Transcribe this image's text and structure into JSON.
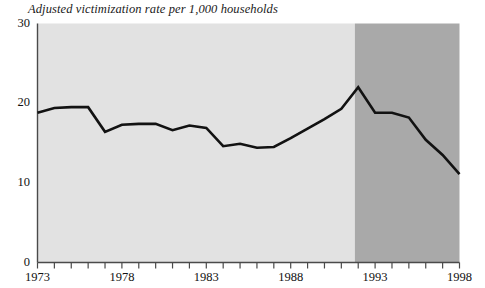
{
  "chart_data": {
    "type": "line",
    "title": "Adjusted victimization rate per 1,000 households",
    "xlabel": "",
    "ylabel": "",
    "ylim": [
      0,
      30
    ],
    "xlim": [
      1973,
      1998
    ],
    "grid": false,
    "legend": null,
    "y_ticks": [
      "0",
      "10",
      "20",
      "30"
    ],
    "y_tick_values": [
      0,
      10,
      20,
      30
    ],
    "x_tick_labels": [
      "1973",
      "1978",
      "1983",
      "1988",
      "1993",
      "1998"
    ],
    "x_tick_label_values": [
      1973,
      1978,
      1983,
      1988,
      1993,
      1998
    ],
    "x_minor_tick_values": [
      1973,
      1974,
      1975,
      1976,
      1977,
      1978,
      1979,
      1980,
      1981,
      1982,
      1983,
      1984,
      1985,
      1986,
      1987,
      1988,
      1989,
      1990,
      1991,
      1992,
      1993,
      1994,
      1995,
      1996,
      1997,
      1998
    ],
    "x": [
      1973,
      1974,
      1975,
      1976,
      1977,
      1978,
      1979,
      1980,
      1981,
      1982,
      1983,
      1984,
      1985,
      1986,
      1987,
      1988,
      1989,
      1990,
      1991,
      1992,
      1993,
      1994,
      1995,
      1996,
      1997,
      1998
    ],
    "values": [
      18.8,
      19.4,
      19.5,
      19.5,
      16.4,
      17.3,
      17.4,
      17.4,
      16.6,
      17.2,
      16.9,
      14.6,
      14.9,
      14.4,
      14.5,
      15.6,
      16.8,
      18.0,
      19.3,
      22.0,
      18.8,
      18.8,
      18.2,
      15.4,
      13.5,
      11.1
    ],
    "series_color": "#121212",
    "line_width": 2.6,
    "bands": [
      {
        "name": "light-band",
        "from": 1973,
        "to": 1991.8,
        "color": "#e2e2e2"
      },
      {
        "name": "dark-band",
        "from": 1991.8,
        "to": 1998,
        "color": "#a9a9a9"
      }
    ],
    "axis_color": "#4a4a4a"
  }
}
